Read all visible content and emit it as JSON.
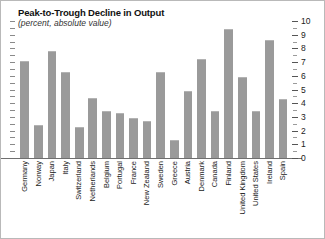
{
  "chart_data": {
    "type": "bar",
    "title": "Peak-to-Trough Decline in Output",
    "subtitle": "(percent, absolute value)",
    "xlabel": "",
    "ylabel": "",
    "ylim": [
      0,
      10
    ],
    "y_ticks": [
      0,
      1,
      2,
      3,
      4,
      5,
      6,
      7,
      8,
      9,
      10
    ],
    "y_tick_labels": [
      "0",
      "1",
      "2",
      "3",
      "4",
      "5",
      "6",
      "7",
      "8",
      "9",
      "10"
    ],
    "axis_position": "right",
    "grid": false,
    "legend": "none",
    "bar_color": "#9a9a9a",
    "categories": [
      "Germany",
      "Norway",
      "Japan",
      "Italy",
      "Switzerland",
      "Netherlands",
      "Belgium",
      "Portugal",
      "France",
      "New Zealand",
      "Sweden",
      "Greece",
      "Austria",
      "Denmark",
      "Canada",
      "Finland",
      "United Kingdom",
      "United States",
      "Ireland",
      "Spain"
    ],
    "values": [
      7.1,
      2.4,
      7.8,
      6.3,
      2.3,
      4.4,
      3.4,
      3.3,
      2.9,
      2.7,
      6.3,
      1.3,
      4.9,
      7.2,
      3.4,
      9.4,
      5.9,
      3.4,
      8.6,
      4.3
    ]
  }
}
